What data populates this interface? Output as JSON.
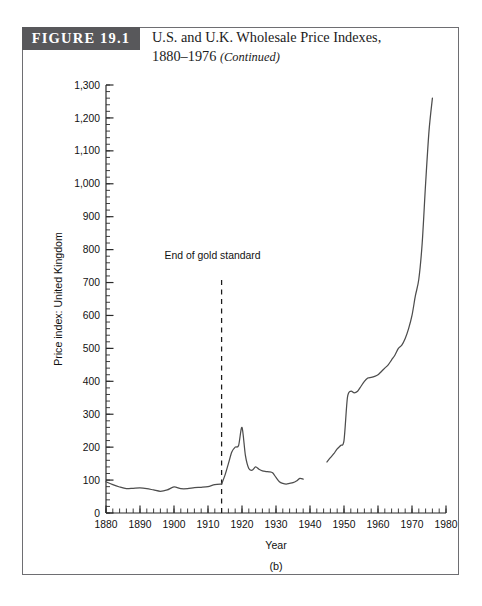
{
  "figure": {
    "banner_label": "FIGURE 19.1",
    "title_line1": "U.S. and U.K. Wholesale Price Indexes,",
    "title_line2_year": "1880–1976",
    "title_line2_note": "(Continued)"
  },
  "chart_data": {
    "type": "line",
    "title": "U.S. and U.K. Wholesale Price Indexes, 1880–1976",
    "panel_label": "(b)",
    "xlabel": "Year",
    "ylabel": "Price index: United Kingdom",
    "xlim": [
      1880,
      1980
    ],
    "ylim": [
      0,
      1300
    ],
    "grid": false,
    "legend": "none",
    "x_ticks": [
      1880,
      1890,
      1900,
      1910,
      1920,
      1930,
      1940,
      1950,
      1960,
      1970,
      1980
    ],
    "x_tick_labels": [
      "1880",
      "1890",
      "1900",
      "1910",
      "1920",
      "1930",
      "1940",
      "1950",
      "1960",
      "1970",
      "1980"
    ],
    "x_minor_tick_step": 2,
    "y_ticks": [
      0,
      100,
      200,
      300,
      400,
      500,
      600,
      700,
      800,
      900,
      1000,
      1100,
      1200,
      1300
    ],
    "y_tick_labels": [
      "0",
      "100",
      "200",
      "300",
      "400",
      "500",
      "600",
      "700",
      "800",
      "900",
      "1,000",
      "1,100",
      "1,200",
      "1,300"
    ],
    "y_minor_tick_step": 20,
    "line_color": "#4d4d4d",
    "annotations": [
      {
        "text": "End of gold standard",
        "x": 1914,
        "label_y": 770,
        "line_type": "dashed",
        "line_y_from": 0,
        "line_y_to": 720
      }
    ],
    "series": [
      {
        "name": "U.K. wholesale price index (pre-war)",
        "segment": 1,
        "x": [
          1880,
          1882,
          1884,
          1886,
          1888,
          1890,
          1892,
          1894,
          1896,
          1898,
          1900,
          1902,
          1904,
          1906,
          1908,
          1910,
          1912,
          1914
        ],
        "values": [
          95,
          86,
          79,
          74,
          75,
          76,
          74,
          70,
          66,
          70,
          79,
          74,
          74,
          77,
          78,
          80,
          86,
          88
        ]
      },
      {
        "name": "U.K. wholesale price index (war and interwar)",
        "segment": 2,
        "x": [
          1914,
          1915,
          1916,
          1917,
          1918,
          1919,
          1920,
          1921,
          1922,
          1923,
          1924,
          1925,
          1926,
          1927,
          1928,
          1929,
          1930,
          1931,
          1932,
          1933,
          1934,
          1935,
          1936,
          1937,
          1938
        ],
        "values": [
          88,
          115,
          150,
          185,
          200,
          205,
          260,
          175,
          135,
          130,
          140,
          133,
          128,
          126,
          125,
          122,
          108,
          95,
          90,
          88,
          90,
          92,
          97,
          105,
          103
        ]
      },
      {
        "name": "U.K. wholesale price index (postwar)",
        "segment": 3,
        "x": [
          1945,
          1946,
          1947,
          1948,
          1949,
          1950,
          1951,
          1952,
          1953,
          1954,
          1955,
          1956,
          1957,
          1958,
          1959,
          1960,
          1961,
          1962,
          1963,
          1964,
          1965,
          1966,
          1967,
          1968,
          1969,
          1970,
          1971,
          1972,
          1973,
          1974,
          1975,
          1976
        ],
        "values": [
          155,
          168,
          180,
          195,
          205,
          220,
          350,
          370,
          365,
          370,
          385,
          400,
          410,
          412,
          415,
          420,
          430,
          440,
          450,
          465,
          480,
          500,
          510,
          530,
          560,
          600,
          660,
          710,
          820,
          1000,
          1160,
          1260
        ]
      }
    ]
  }
}
